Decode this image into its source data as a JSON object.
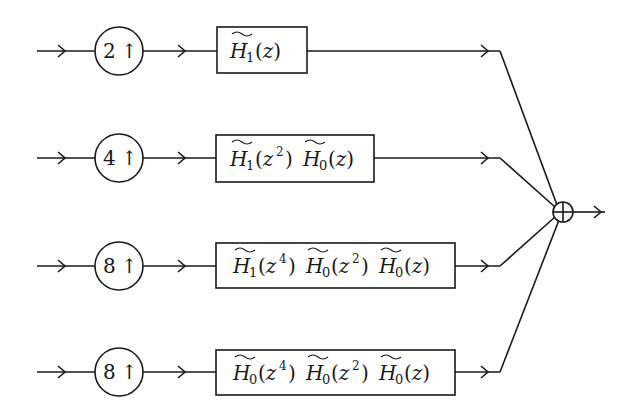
{
  "diagram": {
    "type": "block-diagram",
    "colors": {
      "stroke": "#1a1a1a",
      "background": "#ffffff"
    },
    "branches": [
      {
        "upsampler": {
          "factor": "2",
          "symbol": "↑"
        },
        "filter": {
          "terms": [
            {
              "base": "H",
              "sub": "1",
              "arg_var": "z",
              "arg_pow": ""
            }
          ]
        },
        "filter_text": "H̃1(z)"
      },
      {
        "upsampler": {
          "factor": "4",
          "symbol": "↑"
        },
        "filter": {
          "terms": [
            {
              "base": "H",
              "sub": "1",
              "arg_var": "z",
              "arg_pow": "2"
            },
            {
              "base": "H",
              "sub": "0",
              "arg_var": "z",
              "arg_pow": ""
            }
          ]
        },
        "filter_text": "H̃1(z²)H̃0(z)"
      },
      {
        "upsampler": {
          "factor": "8",
          "symbol": "↑"
        },
        "filter": {
          "terms": [
            {
              "base": "H",
              "sub": "1",
              "arg_var": "z",
              "arg_pow": "4"
            },
            {
              "base": "H",
              "sub": "0",
              "arg_var": "z",
              "arg_pow": "2"
            },
            {
              "base": "H",
              "sub": "0",
              "arg_var": "z",
              "arg_pow": ""
            }
          ]
        },
        "filter_text": "H̃1(z⁴)H̃0(z²)H̃0(z)"
      },
      {
        "upsampler": {
          "factor": "8",
          "symbol": "↑"
        },
        "filter": {
          "terms": [
            {
              "base": "H",
              "sub": "0",
              "arg_var": "z",
              "arg_pow": "4"
            },
            {
              "base": "H",
              "sub": "0",
              "arg_var": "z",
              "arg_pow": "2"
            },
            {
              "base": "H",
              "sub": "0",
              "arg_var": "z",
              "arg_pow": ""
            }
          ]
        },
        "filter_text": "H̃0(z⁴)H̃0(z²)H̃0(z)"
      }
    ],
    "summing_junction": {
      "symbol": "⊕"
    }
  }
}
